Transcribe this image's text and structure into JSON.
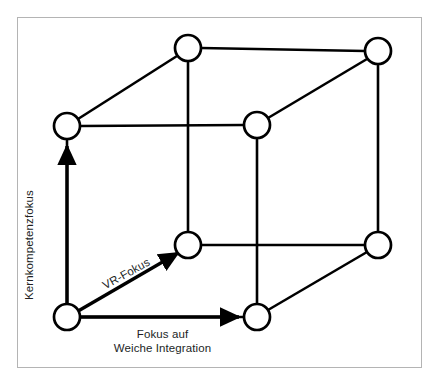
{
  "figure": {
    "type": "cube-diagram",
    "frame_color": "#b4b4b4",
    "stroke_color": "#000000",
    "text_color": "#221f1f",
    "node_fill": "#ffffff"
  },
  "labels": {
    "vertical_axis": "Kernkompetenzfokus",
    "diagonal_axis": "VR-Fokus",
    "horizontal_axis_line1": "Fokus auf",
    "horizontal_axis_line2": "Weiche Integration"
  },
  "nodes": [
    {
      "id": "front-bottom-left",
      "name": "node-front-bottom-left",
      "cx": 67,
      "cy": 317,
      "r": 13
    },
    {
      "id": "front-top-left",
      "name": "node-front-top-left",
      "cx": 67,
      "cy": 126,
      "r": 13
    },
    {
      "id": "back-bottom-left",
      "name": "node-back-bottom-left",
      "cx": 188,
      "cy": 245,
      "r": 13
    },
    {
      "id": "back-top-left",
      "name": "node-back-top-left",
      "cx": 188,
      "cy": 48,
      "r": 13
    },
    {
      "id": "front-bottom-right",
      "name": "node-front-bottom-right",
      "cx": 257,
      "cy": 317,
      "r": 13
    },
    {
      "id": "front-top-right",
      "name": "node-front-top-right",
      "cx": 257,
      "cy": 125,
      "r": 13
    },
    {
      "id": "back-bottom-right",
      "name": "node-back-bottom-right",
      "cx": 378,
      "cy": 245,
      "r": 13
    },
    {
      "id": "back-top-right",
      "name": "node-back-top-right",
      "cx": 378,
      "cy": 51,
      "r": 13
    }
  ],
  "edges": [
    {
      "name": "edge-front-left-vertical",
      "x1": 67,
      "y1": 304,
      "x2": 67,
      "y2": 139
    },
    {
      "name": "edge-front-top-horizontal",
      "x1": 80,
      "y1": 126,
      "x2": 244,
      "y2": 125
    },
    {
      "name": "edge-front-right-vertical",
      "x1": 257,
      "y1": 138,
      "x2": 257,
      "y2": 304
    },
    {
      "name": "edge-front-bottom-horizontal",
      "x1": 80,
      "y1": 317,
      "x2": 244,
      "y2": 317
    },
    {
      "name": "edge-back-left-vertical",
      "x1": 188,
      "y1": 232,
      "x2": 188,
      "y2": 61
    },
    {
      "name": "edge-back-top-horizontal",
      "x1": 201,
      "y1": 48,
      "x2": 365,
      "y2": 51
    },
    {
      "name": "edge-back-right-vertical",
      "x1": 378,
      "y1": 64,
      "x2": 378,
      "y2": 232
    },
    {
      "name": "edge-back-bottom-horizontal",
      "x1": 201,
      "y1": 245,
      "x2": 365,
      "y2": 245
    },
    {
      "name": "edge-depth-top-left",
      "x1": 78,
      "y1": 119,
      "x2": 177,
      "y2": 56
    },
    {
      "name": "edge-depth-top-right",
      "x1": 268,
      "y1": 118,
      "x2": 367,
      "y2": 59
    },
    {
      "name": "edge-depth-bottom-right",
      "x1": 268,
      "y1": 310,
      "x2": 367,
      "y2": 252
    }
  ],
  "arrows": [
    {
      "name": "arrow-vertical-kernkompetenzfokus",
      "x1": 67,
      "y1": 311,
      "x2": 67,
      "y2": 146
    },
    {
      "name": "arrow-diagonal-vr-fokus",
      "x1": 73,
      "y1": 314,
      "x2": 178,
      "y2": 253
    },
    {
      "name": "arrow-horizontal-weiche-integration",
      "x1": 75,
      "y1": 317,
      "x2": 239,
      "y2": 317
    }
  ]
}
